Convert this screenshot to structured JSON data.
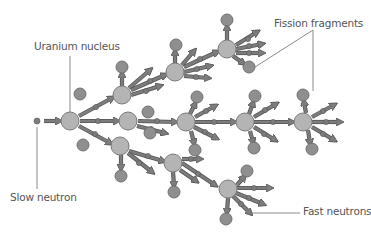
{
  "labels": {
    "uranium_nucleus": "Uranium nucleus",
    "fission_fragments": "Fission fragments",
    "slow_neutron": "Slow neutron",
    "fast_neutrons": "Fast neutrons"
  },
  "colors": {
    "nucleus_fill": "#b4b4b4",
    "nucleus_stroke": "#7a7a7a",
    "fragment_fill": "#8f8f8f",
    "fragment_stroke": "#6a6a6a",
    "neutron_fill": "#7c7c7c",
    "arrow_fill": "#7d7d7d",
    "arrow_stroke": "#555555",
    "leader_line": "#8a8a8a",
    "label_text": "#555555"
  },
  "diagram": {
    "slow_neutron": {
      "x": 37,
      "y": 121
    },
    "nuclei": [
      {
        "id": "g1",
        "x": 70,
        "y": 121,
        "r": 9
      },
      {
        "id": "g2a",
        "x": 122,
        "y": 95,
        "r": 9
      },
      {
        "id": "g2b",
        "x": 128,
        "y": 121,
        "r": 9
      },
      {
        "id": "g2c",
        "x": 120,
        "y": 146,
        "r": 9
      },
      {
        "id": "g3a",
        "x": 175,
        "y": 72,
        "r": 9
      },
      {
        "id": "g3b",
        "x": 186,
        "y": 122,
        "r": 9
      },
      {
        "id": "g3c",
        "x": 173,
        "y": 163,
        "r": 9
      },
      {
        "id": "g4a",
        "x": 227,
        "y": 49,
        "r": 9
      },
      {
        "id": "g4b",
        "x": 245,
        "y": 122,
        "r": 9
      },
      {
        "id": "g4c",
        "x": 228,
        "y": 189,
        "r": 9
      },
      {
        "id": "g5b",
        "x": 303,
        "y": 122,
        "r": 9
      }
    ],
    "fragments": [
      {
        "x": 80,
        "y": 94,
        "r": 6
      },
      {
        "x": 83,
        "y": 145,
        "r": 6
      },
      {
        "x": 122,
        "y": 67,
        "r": 6
      },
      {
        "x": 121,
        "y": 176,
        "r": 6
      },
      {
        "x": 176,
        "y": 45,
        "r": 6
      },
      {
        "x": 227,
        "y": 20,
        "r": 6
      },
      {
        "x": 249,
        "y": 67,
        "r": 6
      },
      {
        "x": 148,
        "y": 112,
        "r": 6
      },
      {
        "x": 150,
        "y": 133,
        "r": 6
      },
      {
        "x": 197,
        "y": 97,
        "r": 6
      },
      {
        "x": 195,
        "y": 150,
        "r": 6
      },
      {
        "x": 255,
        "y": 96,
        "r": 6
      },
      {
        "x": 254,
        "y": 148,
        "r": 6
      },
      {
        "x": 303,
        "y": 95,
        "r": 6
      },
      {
        "x": 312,
        "y": 149,
        "r": 6
      },
      {
        "x": 174,
        "y": 192,
        "r": 6
      },
      {
        "x": 247,
        "y": 171,
        "r": 6
      },
      {
        "x": 226,
        "y": 219,
        "r": 6
      }
    ],
    "arrows": [
      {
        "x1": 44,
        "y1": 121,
        "x2": 59,
        "y2": 121
      },
      {
        "x1": 79,
        "y1": 116,
        "x2": 112,
        "y2": 98
      },
      {
        "x1": 80,
        "y1": 121,
        "x2": 117,
        "y2": 121
      },
      {
        "x1": 79,
        "y1": 126,
        "x2": 110,
        "y2": 143
      },
      {
        "x1": 131,
        "y1": 90,
        "x2": 165,
        "y2": 75
      },
      {
        "x1": 131,
        "y1": 95,
        "x2": 160,
        "y2": 86
      },
      {
        "x1": 129,
        "y1": 88,
        "x2": 150,
        "y2": 70
      },
      {
        "x1": 138,
        "y1": 121,
        "x2": 175,
        "y2": 122
      },
      {
        "x1": 137,
        "y1": 126,
        "x2": 165,
        "y2": 133
      },
      {
        "x1": 129,
        "y1": 151,
        "x2": 163,
        "y2": 161
      },
      {
        "x1": 128,
        "y1": 153,
        "x2": 152,
        "y2": 172
      },
      {
        "x1": 121,
        "y1": 155,
        "x2": 121,
        "y2": 168
      },
      {
        "x1": 122,
        "y1": 86,
        "x2": 122,
        "y2": 74
      },
      {
        "x1": 184,
        "y1": 67,
        "x2": 217,
        "y2": 52
      },
      {
        "x1": 184,
        "y1": 72,
        "x2": 210,
        "y2": 66
      },
      {
        "x1": 184,
        "y1": 76,
        "x2": 208,
        "y2": 78
      },
      {
        "x1": 182,
        "y1": 65,
        "x2": 194,
        "y2": 51
      },
      {
        "x1": 175,
        "y1": 63,
        "x2": 175,
        "y2": 52
      },
      {
        "x1": 236,
        "y1": 45,
        "x2": 257,
        "y2": 32
      },
      {
        "x1": 236,
        "y1": 49,
        "x2": 262,
        "y2": 44
      },
      {
        "x1": 236,
        "y1": 53,
        "x2": 262,
        "y2": 53
      },
      {
        "x1": 227,
        "y1": 40,
        "x2": 227,
        "y2": 27
      },
      {
        "x1": 233,
        "y1": 56,
        "x2": 243,
        "y2": 63
      },
      {
        "x1": 195,
        "y1": 122,
        "x2": 234,
        "y2": 122
      },
      {
        "x1": 195,
        "y1": 117,
        "x2": 215,
        "y2": 106
      },
      {
        "x1": 194,
        "y1": 127,
        "x2": 216,
        "y2": 138
      },
      {
        "x1": 190,
        "y1": 114,
        "x2": 195,
        "y2": 104
      },
      {
        "x1": 191,
        "y1": 131,
        "x2": 194,
        "y2": 143
      },
      {
        "x1": 254,
        "y1": 122,
        "x2": 292,
        "y2": 122
      },
      {
        "x1": 254,
        "y1": 117,
        "x2": 276,
        "y2": 104
      },
      {
        "x1": 254,
        "y1": 127,
        "x2": 275,
        "y2": 140
      },
      {
        "x1": 249,
        "y1": 114,
        "x2": 253,
        "y2": 103
      },
      {
        "x1": 250,
        "y1": 131,
        "x2": 253,
        "y2": 142
      },
      {
        "x1": 312,
        "y1": 122,
        "x2": 340,
        "y2": 122
      },
      {
        "x1": 312,
        "y1": 117,
        "x2": 334,
        "y2": 105
      },
      {
        "x1": 312,
        "y1": 127,
        "x2": 334,
        "y2": 140
      },
      {
        "x1": 306,
        "y1": 113,
        "x2": 304,
        "y2": 102
      },
      {
        "x1": 308,
        "y1": 130,
        "x2": 310,
        "y2": 143
      },
      {
        "x1": 182,
        "y1": 163,
        "x2": 215,
        "y2": 185
      },
      {
        "x1": 182,
        "y1": 159,
        "x2": 200,
        "y2": 159
      },
      {
        "x1": 173,
        "y1": 172,
        "x2": 174,
        "y2": 185
      },
      {
        "x1": 180,
        "y1": 170,
        "x2": 196,
        "y2": 181
      },
      {
        "x1": 237,
        "y1": 185,
        "x2": 244,
        "y2": 177
      },
      {
        "x1": 237,
        "y1": 188,
        "x2": 270,
        "y2": 188
      },
      {
        "x1": 236,
        "y1": 193,
        "x2": 263,
        "y2": 204
      },
      {
        "x1": 233,
        "y1": 196,
        "x2": 250,
        "y2": 213
      },
      {
        "x1": 228,
        "y1": 198,
        "x2": 227,
        "y2": 212
      }
    ],
    "neutron_dots": [
      {
        "x": 96,
        "y": 107
      },
      {
        "x": 98,
        "y": 121
      },
      {
        "x": 95,
        "y": 134
      },
      {
        "x": 150,
        "y": 81
      },
      {
        "x": 146,
        "y": 91
      },
      {
        "x": 157,
        "y": 121
      },
      {
        "x": 151,
        "y": 129
      },
      {
        "x": 148,
        "y": 156
      },
      {
        "x": 139,
        "y": 163
      },
      {
        "x": 200,
        "y": 59
      },
      {
        "x": 197,
        "y": 69
      },
      {
        "x": 196,
        "y": 77
      },
      {
        "x": 248,
        "y": 39
      },
      {
        "x": 249,
        "y": 46
      },
      {
        "x": 249,
        "y": 53
      },
      {
        "x": 214,
        "y": 122
      },
      {
        "x": 206,
        "y": 111
      },
      {
        "x": 205,
        "y": 132
      },
      {
        "x": 273,
        "y": 122
      },
      {
        "x": 265,
        "y": 110
      },
      {
        "x": 264,
        "y": 134
      },
      {
        "x": 326,
        "y": 122
      },
      {
        "x": 323,
        "y": 111
      },
      {
        "x": 323,
        "y": 134
      },
      {
        "x": 198,
        "y": 174
      },
      {
        "x": 191,
        "y": 159
      },
      {
        "x": 254,
        "y": 188
      },
      {
        "x": 249,
        "y": 198
      },
      {
        "x": 241,
        "y": 204
      }
    ],
    "leader_lines": [
      {
        "name": "uranium-nucleus-leader",
        "x1": 70,
        "y1": 56,
        "x2": 70,
        "y2": 112
      },
      {
        "name": "slow-neutron-leader",
        "x1": 37,
        "y1": 127,
        "x2": 37,
        "y2": 189
      },
      {
        "name": "fission-fragments-leader-a",
        "x1": 313,
        "y1": 30,
        "x2": 255,
        "y2": 67
      },
      {
        "name": "fission-fragments-leader-b",
        "x1": 313,
        "y1": 30,
        "x2": 313,
        "y2": 91
      },
      {
        "name": "fast-neutrons-leader",
        "x1": 247,
        "y1": 213,
        "x2": 300,
        "y2": 213
      }
    ]
  }
}
